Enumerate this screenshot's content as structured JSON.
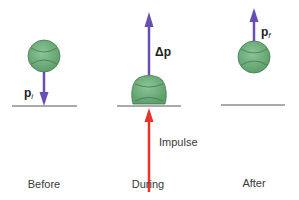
{
  "diagram": {
    "panels": [
      {
        "id": "before",
        "caption": "Before",
        "vector_label": "p",
        "vector_sub": "i",
        "vector_direction": "down"
      },
      {
        "id": "during",
        "caption": "During",
        "vector_label": "Δp",
        "vector_direction": "up",
        "impulse_label": "Impulse"
      },
      {
        "id": "after",
        "caption": "After",
        "vector_label": "p",
        "vector_sub": "f",
        "vector_direction": "up"
      }
    ],
    "colors": {
      "ball_fill": "#6db07a",
      "ball_stroke": "#3f7a4c",
      "momentum_arrow": "#6a4fb3",
      "impulse_arrow": "#e8332a",
      "ground": "#555555",
      "text": "#3a3a3a"
    }
  }
}
